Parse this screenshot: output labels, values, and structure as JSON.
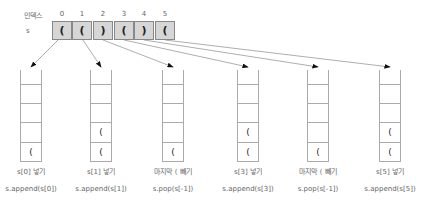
{
  "array": {
    "index_label": "인덱스",
    "name_label": "s",
    "indices": [
      "0",
      "1",
      "2",
      "3",
      "4",
      "5"
    ],
    "values": [
      "(",
      "(",
      ")",
      "(",
      ")",
      "("
    ]
  },
  "stacks": [
    {
      "slots": [
        "",
        "",
        "",
        "",
        "("
      ],
      "step": "s[0] 넣기",
      "code": "s.append(s[0])"
    },
    {
      "slots": [
        "",
        "",
        "",
        "(",
        "("
      ],
      "step": "s[1] 넣기",
      "code": "s.append(s[1])"
    },
    {
      "slots": [
        "",
        "",
        "",
        "",
        "("
      ],
      "step": "마지막 ( 빼기",
      "code": "s.pop(s[-1])"
    },
    {
      "slots": [
        "",
        "",
        "",
        "(",
        "("
      ],
      "step": "s[3] 넣기",
      "code": "s.append(s[3])"
    },
    {
      "slots": [
        "",
        "",
        "",
        "",
        "("
      ],
      "step": "마지막 ( 빼기",
      "code": "s.pop(s[-1])"
    },
    {
      "slots": [
        "",
        "",
        "",
        "(",
        "("
      ],
      "step": "s[5] 넣기",
      "code": "s.append(s[5])"
    }
  ],
  "colors": {
    "cell_fill": "#d6d6d6",
    "line": "#888888",
    "arrow": "#111111"
  }
}
